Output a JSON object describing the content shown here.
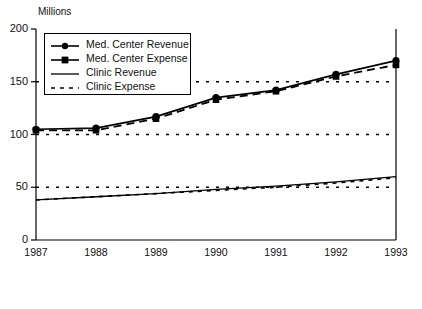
{
  "chart_data": {
    "type": "line",
    "title": "",
    "ylabel": "Millions",
    "xlabel": "",
    "categories": [
      "1987",
      "1988",
      "1989",
      "1990",
      "1991",
      "1992",
      "1993"
    ],
    "x": [
      1987,
      1988,
      1989,
      1990,
      1991,
      1992,
      1993
    ],
    "ylim": [
      0,
      200
    ],
    "yticks": [
      0,
      50,
      100,
      150,
      200
    ],
    "ytick_labels": [
      "0",
      "50",
      "100",
      "150",
      "200"
    ],
    "grid": "horizontal-dotted",
    "gridlines": [
      50,
      100,
      150
    ],
    "legend_position": "upper-left-inside",
    "series": [
      {
        "name": "Med. Center Revenue",
        "marker": "circle",
        "linestyle": "solid",
        "values": [
          105,
          106,
          117,
          135,
          142,
          157,
          170
        ]
      },
      {
        "name": "Med. Center Expense",
        "marker": "square",
        "linestyle": "dashed",
        "values": [
          104,
          104,
          115,
          133,
          141,
          155,
          166
        ]
      },
      {
        "name": "Clinic Revenue",
        "marker": "none",
        "linestyle": "solid",
        "values": [
          38,
          41,
          44,
          48,
          51,
          55,
          60
        ]
      },
      {
        "name": "Clinic Expense",
        "marker": "none",
        "linestyle": "dotted",
        "values": [
          38,
          41,
          44,
          47,
          50,
          54,
          59
        ]
      }
    ]
  },
  "axis": {
    "y_title": "Millions"
  }
}
